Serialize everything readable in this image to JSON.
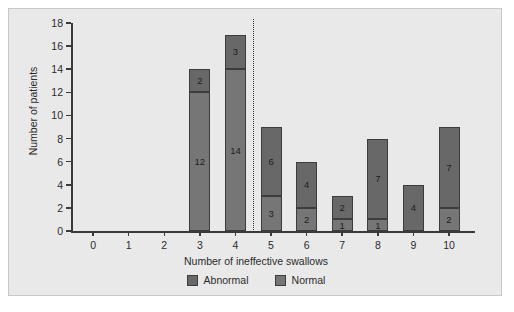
{
  "chart_data": {
    "type": "bar",
    "title": "",
    "xlabel": "Number of ineffective swallows",
    "ylabel": "Number of patients",
    "categories": [
      "0",
      "1",
      "2",
      "3",
      "4",
      "5",
      "6",
      "7",
      "8",
      "9",
      "10"
    ],
    "ylim": [
      0,
      18
    ],
    "yticks": [
      "0",
      "2",
      "4",
      "6",
      "8",
      "10",
      "12",
      "14",
      "16",
      "18"
    ],
    "grid": false,
    "stacked": true,
    "legend_position": "bottom",
    "series": [
      {
        "name": "Normal",
        "color": "#767676",
        "values": [
          0,
          0,
          0,
          12,
          14,
          3,
          2,
          1,
          1,
          0,
          2
        ]
      },
      {
        "name": "Abnormal",
        "color": "#686868",
        "values": [
          0,
          0,
          0,
          2,
          3,
          6,
          4,
          2,
          7,
          4,
          7
        ]
      }
    ],
    "totals": [
      0,
      0,
      0,
      14,
      17,
      9,
      6,
      3,
      8,
      4,
      9
    ],
    "annotations": {
      "divider": {
        "type": "vertical-dotted-line",
        "between": [
          "4",
          "5"
        ],
        "position_x": 4.5
      }
    },
    "bar_labels": {
      "3": {
        "normal": "12",
        "abnormal": "2"
      },
      "4": {
        "normal": "14",
        "abnormal": "3"
      },
      "5": {
        "normal": "3",
        "abnormal": "6"
      },
      "6": {
        "normal": "2",
        "abnormal": "4"
      },
      "7": {
        "normal": "1",
        "abnormal": "2"
      },
      "8": {
        "normal": "1",
        "abnormal": "7"
      },
      "9": {
        "normal": "",
        "abnormal": "4"
      },
      "10": {
        "normal": "2",
        "abnormal": "7"
      }
    }
  },
  "legend": {
    "items": [
      {
        "label": "Abnormal",
        "color": "#686868"
      },
      {
        "label": "Normal",
        "color": "#767676"
      }
    ]
  }
}
